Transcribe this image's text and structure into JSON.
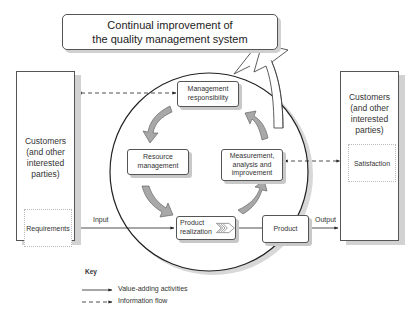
{
  "title": {
    "line1": "Continual improvement of",
    "line2": "the quality management system"
  },
  "left_party": {
    "line1": "Customers",
    "line2": "(and other",
    "line3": "interested",
    "line4": "parties)",
    "inner_label": "Requirements"
  },
  "right_party": {
    "line1": "Customers",
    "line2": "(and other",
    "line3": "interested",
    "line4": "parties)",
    "inner_label": "Satisfaction"
  },
  "processes": {
    "management": {
      "line1": "Management",
      "line2": "responsibility"
    },
    "resource": {
      "line1": "Resource",
      "line2": "management"
    },
    "measurement": {
      "line1": "Measurement,",
      "line2": "analysis and",
      "line3": "improvement"
    },
    "realization": {
      "line1": "Product",
      "line2": "realization"
    },
    "product": "Product"
  },
  "flows": {
    "input": "Input",
    "output": "Output"
  },
  "key": {
    "title": "Key",
    "items": [
      {
        "style": "solid",
        "label": "Value-adding activities"
      },
      {
        "style": "dashed",
        "label": "Information flow"
      }
    ]
  },
  "colors": {
    "line": "#222222",
    "arrow_fill": "#a8a8a8",
    "shadow": "#cfcfcf"
  }
}
